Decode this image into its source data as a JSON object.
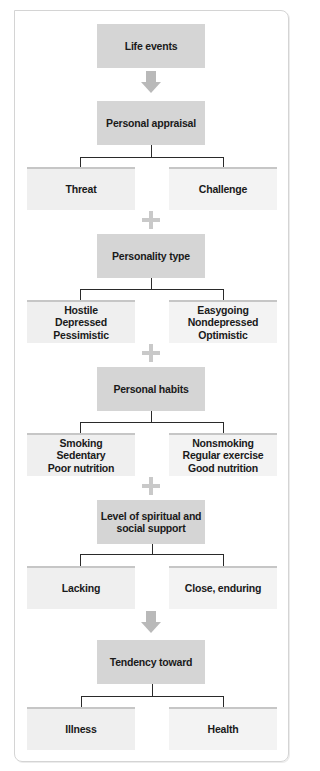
{
  "diagram": {
    "steps": [
      {
        "id": "life-events",
        "label": "Life events"
      },
      {
        "id": "personal-appraisal",
        "label": "Personal appraisal",
        "branches": {
          "left": "Threat",
          "right": "Challenge"
        }
      },
      {
        "id": "personality-type",
        "label": "Personality type",
        "branches": {
          "left": "Hostile\nDepressed\nPessimistic",
          "right": "Easygoing\nNondepressed\nOptimistic"
        }
      },
      {
        "id": "personal-habits",
        "label": "Personal habits",
        "branches": {
          "left": "Smoking\nSedentary\nPoor nutrition",
          "right": "Nonsmoking\nRegular exercise\nGood nutrition"
        }
      },
      {
        "id": "support",
        "label": "Level of spiritual and\nsocial support",
        "branches": {
          "left": "Lacking",
          "right": "Close, enduring"
        }
      },
      {
        "id": "tendency",
        "label": "Tendency toward",
        "branches": {
          "left": "Illness",
          "right": "Health"
        }
      }
    ],
    "connectors": [
      "arrow",
      "plus",
      "plus",
      "plus",
      "arrow"
    ],
    "colors": {
      "main_box": "#d5d5d5",
      "option_box": "#efefef",
      "option_top_border": "#c6c6c6",
      "symbol": "#c0c0c0",
      "line": "#2a2a2a",
      "frame_border": "#d4d4d4"
    }
  }
}
